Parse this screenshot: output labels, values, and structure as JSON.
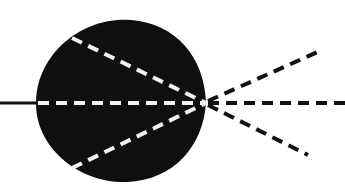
{
  "figure": {
    "canvas": {
      "width": 345,
      "height": 189,
      "background": "#ffffff"
    },
    "colors": {
      "blob_fill": "#100f0f",
      "incident_line": "#111111",
      "internal_ray": "#f2f2f2",
      "external_ray": "#111111"
    },
    "focus_point": {
      "x": 206,
      "y": 103,
      "label": "focus"
    },
    "blob": {
      "name": "dark-medium-blob",
      "shape": "teardrop-circle",
      "center_x": 121,
      "center_y": 101,
      "radius_x": 86,
      "radius_y": 82,
      "left_edge_x": 36,
      "right_apex_x": 207,
      "top_edge_y": 19,
      "bottom_edge_y": 182,
      "path": "M 206 103 C 204 56 176 24 131 20 C 84 16 38 52 36 100 C 34 148 80 184 127 182 C 174 180 203 146 206 103 Z"
    },
    "incident_line": {
      "name": "incident-solid-ray",
      "style": "solid",
      "stroke_width": 3,
      "x1": 0,
      "y1": 103,
      "x2": 40,
      "y2": 103
    },
    "dash_pattern": {
      "dash": 11,
      "gap": 7,
      "stroke_width": 4
    },
    "internal_rays": [
      {
        "name": "internal-ray-upper",
        "x1": 72,
        "y1": 38,
        "x2": 206,
        "y2": 103,
        "color": "#f2f2f2"
      },
      {
        "name": "internal-ray-axis",
        "x1": 38,
        "y1": 103,
        "x2": 206,
        "y2": 103,
        "color": "#f2f2f2"
      },
      {
        "name": "internal-ray-lower",
        "x1": 72,
        "y1": 168,
        "x2": 206,
        "y2": 103,
        "color": "#f2f2f2"
      }
    ],
    "external_rays": [
      {
        "name": "external-ray-upper",
        "x1": 208,
        "y1": 101,
        "x2": 322,
        "y2": 50,
        "color": "#111111"
      },
      {
        "name": "external-ray-axis",
        "x1": 208,
        "y1": 103,
        "x2": 345,
        "y2": 103,
        "color": "#111111"
      },
      {
        "name": "external-ray-lower",
        "x1": 208,
        "y1": 105,
        "x2": 308,
        "y2": 155,
        "color": "#111111"
      }
    ]
  }
}
